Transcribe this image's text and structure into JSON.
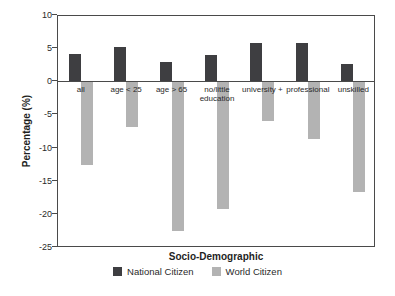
{
  "chart_data": {
    "type": "bar",
    "title": "",
    "xlabel": "Socio-Demographic",
    "ylabel": "Percentage (%)",
    "categories": [
      "all",
      "age < 25",
      "age > 65",
      "no/little education",
      "university +",
      "professional",
      "unskilled"
    ],
    "series": [
      {
        "name": "National Citizen",
        "color": "#3e3e41",
        "values": [
          4.3,
          5.3,
          3.0,
          4.1,
          5.9,
          5.9,
          2.7
        ]
      },
      {
        "name": "World Citizen",
        "color": "#b3b3b3",
        "values": [
          -12.5,
          -6.7,
          -22.5,
          -19.1,
          -5.8,
          -8.6,
          -16.5
        ]
      }
    ],
    "ylim": [
      -25,
      10
    ],
    "yticks": [
      10,
      5,
      0,
      -5,
      -10,
      -15,
      -20,
      -25
    ],
    "grid": false,
    "legend_position": "bottom",
    "axis_color": "#4a4a4a",
    "background": "#ffffff"
  }
}
